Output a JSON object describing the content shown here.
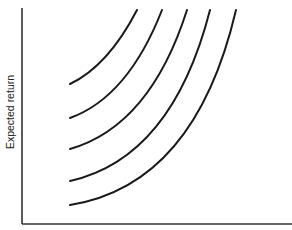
{
  "chart_data": {
    "type": "line",
    "title": "",
    "xlabel": "",
    "ylabel": "Expected return",
    "grid": false,
    "legend": null,
    "axes": {
      "y_axis": {
        "x": 22,
        "y_top": 8,
        "y_bottom": 224
      },
      "x_axis": {
        "y": 224,
        "x_left": 22,
        "x_right": 292
      }
    },
    "series": [
      {
        "name": "curve-1",
        "start": [
          70,
          84
        ],
        "ctrl": [
          108,
          66
        ],
        "end": [
          137,
          10
        ]
      },
      {
        "name": "curve-2",
        "start": [
          70,
          118
        ],
        "ctrl": [
          128,
          97
        ],
        "end": [
          162,
          10
        ]
      },
      {
        "name": "curve-3",
        "start": [
          70,
          149
        ],
        "ctrl": [
          150,
          126
        ],
        "end": [
          187,
          10
        ]
      },
      {
        "name": "curve-4",
        "start": [
          70,
          181
        ],
        "ctrl": [
          172,
          158
        ],
        "end": [
          210,
          10
        ]
      },
      {
        "name": "curve-5",
        "start": [
          70,
          205
        ],
        "ctrl": [
          195,
          185
        ],
        "end": [
          236,
          10
        ]
      }
    ]
  }
}
